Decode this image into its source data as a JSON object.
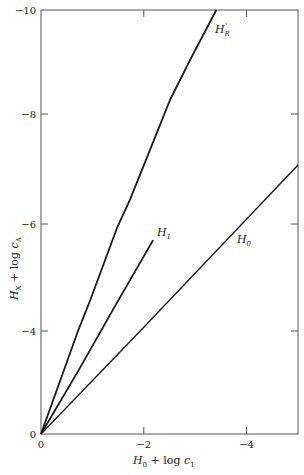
{
  "chart_data": {
    "type": "line",
    "title": "",
    "xlabel": "H_0 + log c_1",
    "ylabel": "H_X + log c_A",
    "xlim": [
      0,
      -5
    ],
    "ylim": [
      0,
      -10
    ],
    "grid": false,
    "legend": "none (inline curve labels)",
    "x_ticks": [
      "0",
      "-2",
      "-4"
    ],
    "y_ticks": [
      "0",
      "-4",
      "-6",
      "-8",
      "-10"
    ],
    "series": [
      {
        "name": "H_R'",
        "points": [
          [
            0,
            0
          ],
          [
            -0.72,
            -4.0
          ],
          [
            -0.96,
            -4.58
          ],
          [
            -1.48,
            -5.93
          ],
          [
            -1.73,
            -6.44
          ],
          [
            -2.12,
            -7.35
          ],
          [
            -2.51,
            -8.27
          ],
          [
            -2.9,
            -9.04
          ],
          [
            -3.41,
            -10.0
          ]
        ]
      },
      {
        "name": "H_1",
        "points": [
          [
            0,
            0
          ],
          [
            -0.74,
            -2.5
          ],
          [
            -1.4,
            -4.4
          ],
          [
            -2.18,
            -5.7
          ]
        ]
      },
      {
        "name": "H_0",
        "points": [
          [
            0,
            0
          ],
          [
            -1.93,
            -4.0
          ],
          [
            -5.0,
            -7.07
          ]
        ]
      }
    ]
  },
  "labels": {
    "x_axis": {
      "main": "H",
      "sub": "0",
      "rest": " + log ",
      "var": "c",
      "var_sub": "1"
    },
    "y_axis": {
      "main": "H",
      "sub": "X",
      "rest": " + log ",
      "var": "c",
      "var_sub": "A"
    },
    "curve_HR": {
      "main": "H",
      "sub": "R",
      "sup": "'"
    },
    "curve_H1": {
      "main": "H",
      "sub": "1"
    },
    "curve_H0": {
      "main": "H",
      "sub": "0"
    },
    "y_origin": "0",
    "x_origin": "0"
  }
}
